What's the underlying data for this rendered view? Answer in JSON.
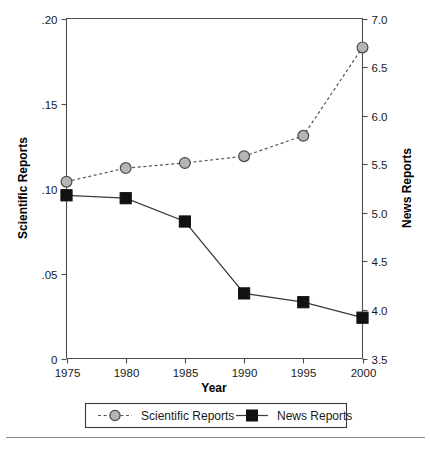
{
  "chart_data": {
    "type": "line",
    "title": "",
    "xlabel": "Year",
    "ylabel": "Scientific Reports",
    "y2label": "News Reports",
    "x": [
      1975,
      1980,
      1985,
      1990,
      1995,
      2000
    ],
    "xticklabels": [
      "1975",
      "1980",
      "1985",
      "1990",
      "1995",
      "2000"
    ],
    "xlim": [
      1975,
      2000
    ],
    "ylim": [
      0,
      0.2
    ],
    "yticks": [
      0,
      0.05,
      0.1,
      0.15,
      0.2
    ],
    "yticklabels": [
      "0",
      ".05",
      ".10",
      ".15",
      ".20"
    ],
    "y2lim": [
      3.5,
      7.0
    ],
    "y2ticks": [
      3.5,
      4.0,
      4.5,
      5.0,
      5.5,
      6.0,
      6.5,
      7.0
    ],
    "y2ticklabels": [
      "3.5",
      "4.0",
      "4.5",
      "5.0",
      "5.5",
      "6.0",
      "6.5",
      "7.0"
    ],
    "grid": false,
    "legend_position": "bottom-outside",
    "series": [
      {
        "name": "Scientific Reports",
        "axis": "left",
        "marker": "circle",
        "linestyle": "dashed",
        "color": "#b5b5b5",
        "edgecolor": "#4a4a4a",
        "values": [
          0.104,
          0.112,
          0.115,
          0.119,
          0.131,
          0.183
        ]
      },
      {
        "name": "News Reports",
        "axis": "right",
        "marker": "square",
        "linestyle": "solid",
        "color": "#111111",
        "edgecolor": "#111111",
        "values": [
          5.18,
          5.15,
          4.91,
          4.17,
          4.08,
          3.92
        ]
      }
    ]
  },
  "legend": {
    "entries": [
      {
        "label": "Scientific Reports",
        "marker": "circle",
        "linestyle": "dashed"
      },
      {
        "label": "News Reports",
        "marker": "square",
        "linestyle": "solid"
      }
    ]
  },
  "colors": {
    "axis": "#4d4d4d",
    "text": "#1a1a1a",
    "sci_marker_fill": "#b5b5b5",
    "sci_marker_edge": "#4a4a4a",
    "news_marker": "#111111",
    "background": "#ffffff",
    "footer_rule": "#8c8c8c"
  }
}
